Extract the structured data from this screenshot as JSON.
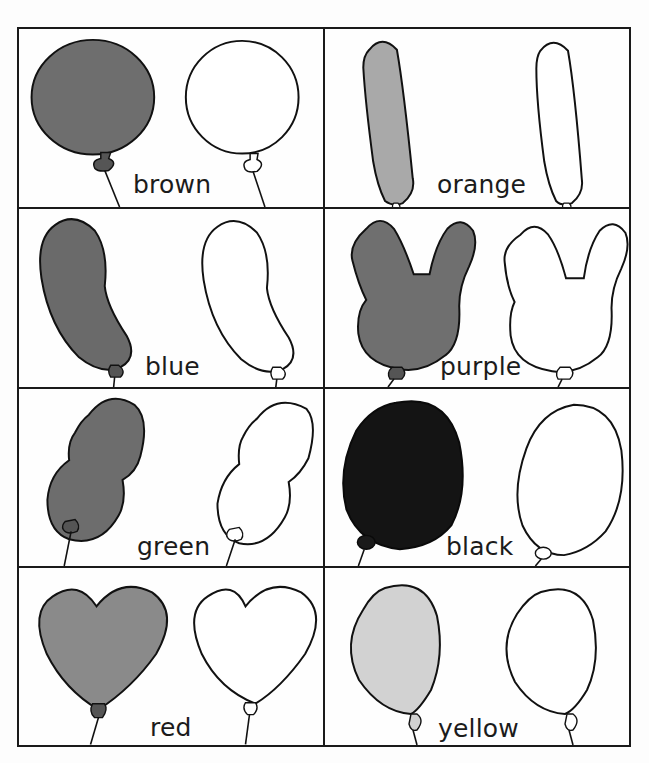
{
  "worksheet": {
    "title": "Balloon color matching",
    "cards": [
      {
        "id": "brown",
        "label": "brown",
        "shape": "round",
        "fill": "#6e6e6e",
        "label_pos": {
          "left": 114,
          "top": 143
        }
      },
      {
        "id": "orange",
        "label": "orange",
        "shape": "long",
        "fill": "#a9a9a9",
        "label_pos": {
          "left": 112,
          "top": 143
        }
      },
      {
        "id": "blue",
        "label": "blue",
        "shape": "bean",
        "fill": "#6a6a6a",
        "label_pos": {
          "left": 126,
          "top": 145
        }
      },
      {
        "id": "purple",
        "label": "purple",
        "shape": "bunny",
        "fill": "#6f6f6f",
        "label_pos": {
          "left": 115,
          "top": 145
        }
      },
      {
        "id": "green",
        "label": "green",
        "shape": "peanut",
        "fill": "#6d6d6d",
        "label_pos": {
          "left": 118,
          "top": 145
        }
      },
      {
        "id": "black",
        "label": "black",
        "shape": "oval",
        "fill": "#141414",
        "label_pos": {
          "left": 121,
          "top": 145
        }
      },
      {
        "id": "red",
        "label": "red",
        "shape": "heart",
        "fill": "#8a8a8a",
        "label_pos": {
          "left": 131,
          "top": 147
        }
      },
      {
        "id": "yellow",
        "label": "yellow",
        "shape": "teardrop",
        "fill": "#d2d2d2",
        "label_pos": {
          "left": 113,
          "top": 148
        }
      }
    ]
  }
}
